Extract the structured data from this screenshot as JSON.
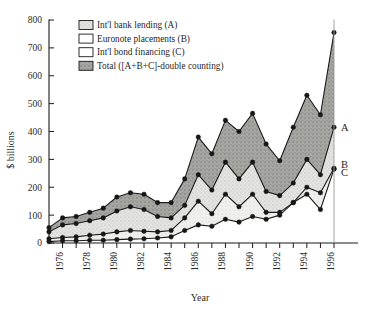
{
  "chart_data": {
    "type": "area",
    "title": "",
    "xlabel": "Year",
    "ylabel": "$ billions",
    "ylim": [
      0,
      800
    ],
    "yticks": [
      0,
      100,
      200,
      300,
      400,
      500,
      600,
      700,
      800
    ],
    "xlim": [
      1975,
      1996
    ],
    "xticks": [
      1976,
      1978,
      1980,
      1982,
      1984,
      1986,
      1988,
      1990,
      1992,
      1994,
      1996
    ],
    "grid": false,
    "legend_position": "top-left",
    "x": [
      1975,
      1976,
      1977,
      1978,
      1979,
      1980,
      1981,
      1982,
      1983,
      1984,
      1985,
      1986,
      1987,
      1988,
      1989,
      1990,
      1991,
      1992,
      1993,
      1994,
      1995,
      1996
    ],
    "series": [
      {
        "name": "Total ([A+B+C]-double counting)",
        "key": "total",
        "swatch": "#8c8c8c",
        "values": [
          55,
          90,
          95,
          110,
          125,
          165,
          180,
          175,
          145,
          145,
          230,
          380,
          320,
          440,
          400,
          465,
          355,
          295,
          415,
          530,
          460,
          755
        ]
      },
      {
        "name": "Int'l bank lending (A)",
        "key": "A",
        "swatch": "#d8d8d8",
        "values": [
          40,
          65,
          70,
          80,
          90,
          115,
          130,
          120,
          95,
          90,
          135,
          245,
          190,
          290,
          230,
          290,
          185,
          170,
          215,
          300,
          245,
          415
        ]
      },
      {
        "name": "Euronote placements (B)",
        "key": "B",
        "swatch": "#ffffff",
        "values": [
          15,
          20,
          22,
          28,
          32,
          40,
          45,
          42,
          40,
          45,
          90,
          150,
          105,
          175,
          130,
          175,
          110,
          110,
          145,
          200,
          180,
          268
        ]
      },
      {
        "name": "Int'l bond financing (C)",
        "key": "C",
        "swatch": "#ffffff",
        "values": [
          5,
          8,
          8,
          10,
          10,
          12,
          14,
          15,
          18,
          22,
          45,
          65,
          60,
          85,
          75,
          95,
          85,
          100,
          145,
          175,
          120,
          265
        ]
      }
    ],
    "point_labels": [
      {
        "text": "A",
        "x": 1996,
        "y": 415
      },
      {
        "text": "B",
        "x": 1996,
        "y": 285
      },
      {
        "text": "C",
        "x": 1996,
        "y": 255
      }
    ]
  },
  "legend": {
    "items": [
      {
        "label": "Int'l bank lending (A)",
        "swatch": "#d8d8d8",
        "pattern": "light-stipple"
      },
      {
        "label": "Euronote placements (B)",
        "swatch": "#ffffff",
        "pattern": "none"
      },
      {
        "label": "Int'l bond financing (C)",
        "swatch": "#ffffff",
        "pattern": "none"
      },
      {
        "label": "Total ([A+B+C]-double counting)",
        "swatch": "#8c8c8c",
        "pattern": "dark-stipple"
      }
    ]
  },
  "axes": {
    "y_title": "$ billions",
    "x_title": "Year"
  }
}
